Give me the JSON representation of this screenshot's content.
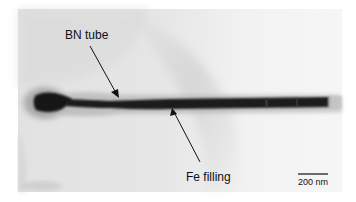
{
  "figure": {
    "type": "TEM micrograph",
    "labels": {
      "tube": "BN tube",
      "filling": "Fe filling"
    },
    "scale_bar": {
      "text": "200 nm"
    },
    "colors": {
      "background": "#ffffff",
      "micrograph_bg": "#ececec",
      "filling": "#151515",
      "sheath": "#9a9a9a",
      "text": "#111111"
    }
  }
}
